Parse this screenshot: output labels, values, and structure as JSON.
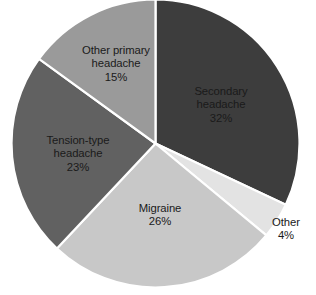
{
  "chart_data": {
    "type": "pie",
    "title": "",
    "subtitle": "",
    "xlabel": "",
    "ylabel": "",
    "legend_position": "none",
    "grid": false,
    "units": "percent",
    "total": 100,
    "categories": [
      "Secondary headache",
      "Other",
      "Migraine",
      "Tension-type headache",
      "Other primary headache"
    ],
    "values": [
      32,
      4,
      26,
      23,
      15
    ],
    "start_angle_deg": 0,
    "direction": "clockwise",
    "slices": [
      {
        "label": "Secondary headache",
        "label_line1": "Secondary",
        "label_line2": "headache",
        "value": 32,
        "value_text": "32%",
        "color": "#3d3d3d",
        "label_placement": "inside",
        "label_text_color": "#1a1a1a"
      },
      {
        "label": "Other",
        "label_line1": "Other",
        "label_line2": "",
        "value": 4,
        "value_text": "4%",
        "color": "#e3e3e3",
        "label_placement": "outside",
        "label_text_color": "#1a1a1a"
      },
      {
        "label": "Migraine",
        "label_line1": "Migraine",
        "label_line2": "",
        "value": 26,
        "value_text": "26%",
        "color": "#c8c8c8",
        "label_placement": "inside",
        "label_text_color": "#1a1a1a"
      },
      {
        "label": "Tension-type headache",
        "label_line1": "Tension-type",
        "label_line2": "headache",
        "value": 23,
        "value_text": "23%",
        "color": "#616161",
        "label_placement": "inside",
        "label_text_color": "#1a1a1a"
      },
      {
        "label": "Other primary headache",
        "label_line1": "Other primary",
        "label_line2": "headache",
        "value": 15,
        "value_text": "15%",
        "color": "#9a9a9a",
        "label_placement": "inside",
        "label_text_color": "#1a1a1a"
      }
    ],
    "background_color": "#ffffff",
    "separator_color": "#ffffff"
  }
}
